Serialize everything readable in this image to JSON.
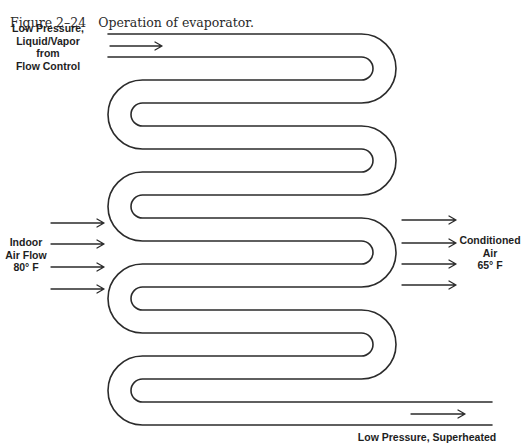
{
  "figure": {
    "number": "Figure 2–24",
    "title": "Operation of evaporator."
  },
  "labels": {
    "inlet": [
      "Low Pressure,",
      "Liquid/Vapor",
      "from",
      "Flow Control"
    ],
    "indoor_air": [
      "Indoor",
      "Air Flow",
      "80° F"
    ],
    "conditioned_air": [
      "Conditioned",
      "Air",
      "65° F"
    ],
    "outlet": [
      "Low Pressure, Superheated"
    ]
  },
  "coil": {
    "passes": 9,
    "first_pass_top_y": 34,
    "tube_width": 23,
    "pass_pitch": 46,
    "left_outer_x": 108,
    "right_outer_x": 396,
    "inlet_start_x": 108,
    "outlet_end_x": 492,
    "stroke_color": "#2b2b2b"
  },
  "arrows": {
    "refrigerant_inlet": {
      "x1": 110,
      "x2": 162,
      "y": 46
    },
    "refrigerant_outlet": {
      "x1": 411,
      "x2": 465,
      "y": 414
    },
    "air_in": {
      "x1": 51,
      "x2": 104,
      "ys": [
        223,
        244,
        267,
        289
      ]
    },
    "air_out": {
      "x1": 402,
      "x2": 456,
      "ys": [
        220,
        243,
        264,
        285
      ]
    }
  }
}
